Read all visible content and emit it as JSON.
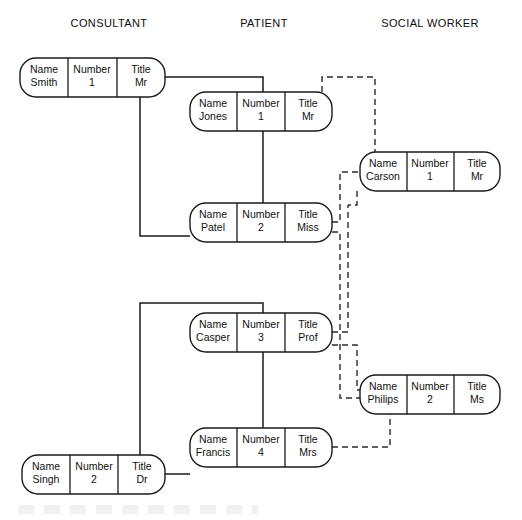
{
  "diagram": {
    "background_color": "#ffffff",
    "line_color": "#1a1a1a",
    "headers": [
      {
        "id": "consultant",
        "label": "CONSULTANT"
      },
      {
        "id": "patient",
        "label": "PATIENT"
      },
      {
        "id": "social-worker",
        "label": "SOCIAL WORKER"
      }
    ],
    "field_labels": {
      "name": "Name",
      "number": "Number",
      "title": "Title"
    },
    "entities": [
      {
        "id": "consultant-smith",
        "column": "consultant",
        "name_label": "Name",
        "name_value": "Smith",
        "number_label": "Number",
        "number_value": "1",
        "title_label": "Title",
        "title_value": "Mr"
      },
      {
        "id": "patient-jones",
        "column": "patient",
        "name_label": "Name",
        "name_value": "Jones",
        "number_label": "Number",
        "number_value": "1",
        "title_label": "Title",
        "title_value": "Mr"
      },
      {
        "id": "social-worker-carson",
        "column": "social-worker",
        "name_label": "Name",
        "name_value": "Carson",
        "number_label": "Number",
        "number_value": "1",
        "title_label": "Title",
        "title_value": "Mr"
      },
      {
        "id": "patient-patel",
        "column": "patient",
        "name_label": "Name",
        "name_value": "Patel",
        "number_label": "Number",
        "number_value": "2",
        "title_label": "Title",
        "title_value": "Miss"
      },
      {
        "id": "patient-casper",
        "column": "patient",
        "name_label": "Name",
        "name_value": "Casper",
        "number_label": "Number",
        "number_value": "3",
        "title_label": "Title",
        "title_value": "Prof"
      },
      {
        "id": "social-worker-philips",
        "column": "social-worker",
        "name_label": "Name",
        "name_value": "Philips",
        "number_label": "Number",
        "number_value": "2",
        "title_label": "Title",
        "title_value": "Ms"
      },
      {
        "id": "patient-francis",
        "column": "patient",
        "name_label": "Name",
        "name_value": "Francis",
        "number_label": "Number",
        "number_value": "4",
        "title_label": "Title",
        "title_value": "Mrs"
      },
      {
        "id": "consultant-singh",
        "column": "consultant",
        "name_label": "Name",
        "name_value": "Singh",
        "number_label": "Number",
        "number_value": "2",
        "title_label": "Title",
        "title_value": "Dr"
      }
    ],
    "links": [
      {
        "id": "smith-jones",
        "style": "solid",
        "from": "consultant-smith",
        "to": "patient-jones"
      },
      {
        "id": "smith-patel",
        "style": "solid",
        "from": "consultant-smith",
        "to": "patient-patel"
      },
      {
        "id": "singh-casper",
        "style": "solid",
        "from": "consultant-singh",
        "to": "patient-casper"
      },
      {
        "id": "singh-francis",
        "style": "solid",
        "from": "consultant-singh",
        "to": "patient-francis"
      },
      {
        "id": "jones-carson",
        "style": "dashed",
        "from": "patient-jones",
        "to": "social-worker-carson"
      },
      {
        "id": "patel-carson",
        "style": "dashed",
        "from": "patient-patel",
        "to": "social-worker-carson"
      },
      {
        "id": "casper-carson",
        "style": "dashed",
        "from": "patient-casper",
        "to": "social-worker-carson"
      },
      {
        "id": "patel-philips",
        "style": "dashed",
        "from": "patient-patel",
        "to": "social-worker-philips"
      },
      {
        "id": "casper-philips",
        "style": "dashed",
        "from": "patient-casper",
        "to": "social-worker-philips"
      },
      {
        "id": "francis-philips",
        "style": "dashed",
        "from": "patient-francis",
        "to": "social-worker-philips"
      }
    ]
  }
}
